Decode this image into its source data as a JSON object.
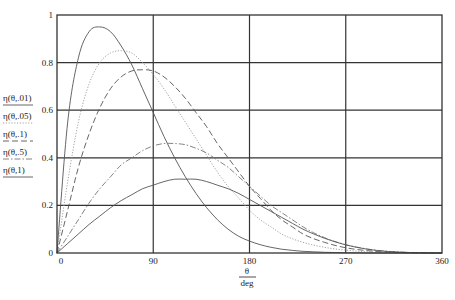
{
  "chart_data": {
    "type": "line",
    "title": "",
    "xlabel_num": "θ",
    "xlabel_den": "deg",
    "ylabel": "",
    "xlim": [
      0,
      360
    ],
    "ylim": [
      0,
      1
    ],
    "grid": true,
    "x_ticks": [
      "0",
      "90",
      "180",
      "270",
      "360"
    ],
    "y_ticks": [
      "0",
      "0.2",
      "0.4",
      "0.6",
      "0.8",
      "1"
    ],
    "legend_position": "left",
    "x": [
      0,
      10,
      20,
      30,
      40,
      50,
      60,
      70,
      80,
      90,
      100,
      110,
      120,
      130,
      140,
      150,
      160,
      170,
      180,
      190,
      200,
      210,
      220,
      230,
      240,
      250,
      260,
      270,
      280,
      290,
      300,
      310,
      320,
      330,
      340,
      350,
      360
    ],
    "series": [
      {
        "name": "η(θ,.01)",
        "style": "solid",
        "values": [
          0,
          0.55,
          0.82,
          0.93,
          0.95,
          0.93,
          0.87,
          0.79,
          0.69,
          0.59,
          0.49,
          0.4,
          0.32,
          0.25,
          0.19,
          0.14,
          0.1,
          0.07,
          0.05,
          0.035,
          0.024,
          0.016,
          0.011,
          0.007,
          0.005,
          0.003,
          0.002,
          0.001,
          0.001,
          0,
          0,
          0,
          0,
          0,
          0,
          0,
          0
        ]
      },
      {
        "name": "η(θ,.05)",
        "style": "dotted",
        "values": [
          0,
          0.3,
          0.55,
          0.71,
          0.8,
          0.84,
          0.85,
          0.84,
          0.8,
          0.75,
          0.69,
          0.62,
          0.55,
          0.48,
          0.41,
          0.34,
          0.28,
          0.23,
          0.18,
          0.14,
          0.11,
          0.08,
          0.06,
          0.045,
          0.033,
          0.024,
          0.017,
          0.012,
          0.008,
          0.005,
          0.003,
          0.002,
          0.001,
          0.001,
          0,
          0,
          0
        ]
      },
      {
        "name": "η(θ,.1)",
        "style": "dashed",
        "values": [
          0,
          0.18,
          0.36,
          0.5,
          0.61,
          0.69,
          0.74,
          0.765,
          0.77,
          0.765,
          0.74,
          0.7,
          0.65,
          0.59,
          0.53,
          0.46,
          0.4,
          0.34,
          0.28,
          0.23,
          0.18,
          0.14,
          0.11,
          0.08,
          0.06,
          0.045,
          0.032,
          0.022,
          0.015,
          0.01,
          0.006,
          0.004,
          0.002,
          0.001,
          0.001,
          0,
          0
        ]
      },
      {
        "name": "η(θ,.5)",
        "style": "dashdot",
        "values": [
          0,
          0.07,
          0.14,
          0.21,
          0.27,
          0.32,
          0.37,
          0.4,
          0.43,
          0.45,
          0.46,
          0.46,
          0.455,
          0.44,
          0.42,
          0.39,
          0.36,
          0.32,
          0.28,
          0.24,
          0.2,
          0.17,
          0.14,
          0.11,
          0.085,
          0.065,
          0.048,
          0.035,
          0.025,
          0.017,
          0.011,
          0.007,
          0.004,
          0.002,
          0.001,
          0,
          0
        ]
      },
      {
        "name": "η(θ,1)",
        "style": "solid",
        "values": [
          0,
          0.04,
          0.08,
          0.12,
          0.155,
          0.19,
          0.22,
          0.245,
          0.27,
          0.285,
          0.3,
          0.31,
          0.31,
          0.31,
          0.3,
          0.285,
          0.27,
          0.25,
          0.225,
          0.2,
          0.175,
          0.15,
          0.125,
          0.1,
          0.08,
          0.062,
          0.047,
          0.034,
          0.024,
          0.016,
          0.01,
          0.006,
          0.004,
          0.002,
          0.001,
          0,
          0
        ]
      }
    ]
  }
}
